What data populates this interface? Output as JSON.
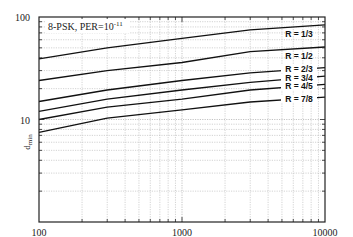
{
  "chart_data": {
    "type": "line",
    "title": "8-PSK, PER=10",
    "title_exponent": "-11",
    "xlabel": "",
    "ylabel": "d",
    "ylabel_subscript": "min",
    "xscale": "log",
    "yscale": "log",
    "xlim": [
      100,
      10000
    ],
    "ylim": [
      1,
      100
    ],
    "grid": true,
    "x_tick_labels": [
      "100",
      "1000",
      "10000"
    ],
    "y_tick_labels": [
      "10",
      "100"
    ],
    "x": [
      100,
      300,
      1000,
      3000,
      10000
    ],
    "series": [
      {
        "name": "R = 1/3",
        "values": [
          39,
          50,
          62,
          75,
          84
        ]
      },
      {
        "name": "R = 1/2",
        "values": [
          24,
          30,
          36,
          46,
          51
        ]
      },
      {
        "name": "R = 2/3",
        "values": [
          15,
          19.4,
          24,
          28.5,
          32
        ]
      },
      {
        "name": "R = 3/4",
        "values": [
          12,
          15.8,
          19.4,
          23,
          26.5
        ]
      },
      {
        "name": "R = 4/5",
        "values": [
          10,
          13.2,
          15.8,
          19.4,
          22
        ]
      },
      {
        "name": "R = 7/8",
        "values": [
          7.5,
          10.3,
          12.4,
          14.8,
          16.5
        ]
      }
    ],
    "legend_position": "inline-right"
  }
}
